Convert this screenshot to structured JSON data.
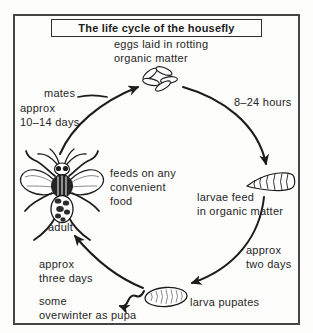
{
  "title": "The life cycle of the housefly",
  "colors": {
    "ink": "#1c1c1c",
    "paper": "#fdfdfc",
    "frame_border": "#454545"
  },
  "cycle": {
    "egg_stage": {
      "line1": "eggs laid in rotting",
      "line2": "organic matter"
    },
    "egg_to_larva_duration": "8–24 hours",
    "larva_stage": {
      "line1": "larvae feed",
      "line2": "in organic matter"
    },
    "larva_to_pupa_duration": {
      "line1": "approx",
      "line2": "two days"
    },
    "pupa_stage": {
      "label": "larva pupates"
    },
    "pupa_overwinter_note": {
      "line1": "some",
      "line2": "overwinter as pupa"
    },
    "pupa_to_adult_duration": {
      "line1": "approx",
      "line2": "three days"
    },
    "adult_stage": {
      "label": "adult",
      "note_line1": "feeds on any",
      "note_line2": "convenient",
      "note_line3": "food"
    },
    "adult_to_egg": {
      "mates_label": "mates",
      "duration_line1": "approx",
      "duration_line2": "10–14 days"
    }
  },
  "figures": {
    "eggs": "housefly-eggs-cluster",
    "larva": "housefly-larva",
    "pupa": "housefly-pupa",
    "adult": "adult-housefly-top-view"
  }
}
